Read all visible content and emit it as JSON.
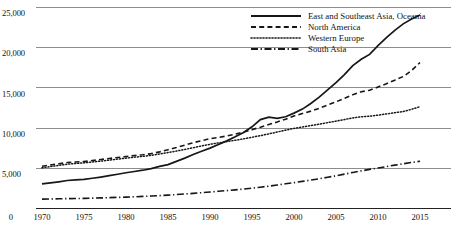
{
  "chart_data": {
    "type": "line",
    "title": "",
    "subtitle": "",
    "xlabel": "",
    "ylabel": "",
    "xlim": [
      1968,
      2016
    ],
    "ylim": [
      0,
      26500
    ],
    "grid": true,
    "legend_position": "top-right-inside",
    "y_ticks": [
      "0",
      "5,000",
      "10,000",
      "15,000",
      "20,000",
      "25,000"
    ],
    "y_tick_values": [
      0,
      5000,
      10000,
      15000,
      20000,
      25000
    ],
    "x_ticks": [
      "0",
      "1970",
      "1975",
      "1980",
      "1985",
      "1990",
      "1995",
      "2000",
      "2005",
      "2010",
      "2015"
    ],
    "x_tick_values": [
      1965,
      1970,
      1975,
      1980,
      1985,
      1990,
      1995,
      2000,
      2005,
      2010,
      2015
    ],
    "x": [
      1970,
      1971,
      1972,
      1973,
      1974,
      1975,
      1976,
      1977,
      1978,
      1979,
      1980,
      1981,
      1982,
      1983,
      1984,
      1985,
      1986,
      1987,
      1988,
      1989,
      1990,
      1991,
      1992,
      1993,
      1994,
      1995,
      1996,
      1997,
      1998,
      1999,
      2000,
      2001,
      2002,
      2003,
      2004,
      2005,
      2006,
      2007,
      2008,
      2009,
      2010,
      2011,
      2012,
      2013,
      2014,
      2015
    ],
    "series": [
      {
        "name": "East and Southeast Asia, Oceania",
        "style": "solid",
        "values": [
          3000,
          3120,
          3260,
          3420,
          3500,
          3560,
          3700,
          3850,
          4020,
          4200,
          4380,
          4540,
          4700,
          4900,
          5180,
          5400,
          5800,
          6200,
          6650,
          7050,
          7450,
          7900,
          8350,
          8850,
          9400,
          10100,
          11000,
          11300,
          11150,
          11350,
          11800,
          12300,
          13000,
          13800,
          14700,
          15600,
          16600,
          17700,
          18500,
          19100,
          20200,
          21200,
          22100,
          22900,
          23500,
          24000
        ]
      },
      {
        "name": "North America",
        "style": "dashed",
        "values": [
          5200,
          5350,
          5500,
          5650,
          5720,
          5780,
          5900,
          6030,
          6160,
          6280,
          6400,
          6530,
          6620,
          6760,
          6980,
          7250,
          7520,
          7820,
          8120,
          8380,
          8620,
          8780,
          8950,
          9180,
          9450,
          9750,
          10050,
          10380,
          10700,
          11050,
          11450,
          11750,
          12050,
          12400,
          12800,
          13200,
          13650,
          14100,
          14450,
          14650,
          15050,
          15450,
          15900,
          16350,
          17100,
          18100
        ]
      },
      {
        "name": "Western Europe",
        "style": "dotted",
        "values": [
          5000,
          5150,
          5300,
          5450,
          5530,
          5620,
          5720,
          5830,
          5950,
          6080,
          6200,
          6320,
          6420,
          6550,
          6720,
          6900,
          7080,
          7280,
          7500,
          7720,
          7920,
          8100,
          8260,
          8420,
          8600,
          8800,
          9000,
          9220,
          9450,
          9680,
          9900,
          10080,
          10250,
          10420,
          10620,
          10800,
          11000,
          11200,
          11350,
          11420,
          11550,
          11700,
          11850,
          12000,
          12280,
          12600
        ]
      },
      {
        "name": "South Asia",
        "style": "dashdot",
        "values": [
          1100,
          1125,
          1145,
          1165,
          1180,
          1200,
          1225,
          1255,
          1290,
          1320,
          1355,
          1395,
          1440,
          1490,
          1545,
          1605,
          1670,
          1740,
          1820,
          1905,
          1990,
          2075,
          2165,
          2260,
          2360,
          2470,
          2590,
          2720,
          2860,
          3010,
          3160,
          3310,
          3470,
          3640,
          3820,
          4010,
          4210,
          4420,
          4620,
          4800,
          4980,
          5150,
          5330,
          5500,
          5660,
          5820
        ]
      }
    ]
  }
}
